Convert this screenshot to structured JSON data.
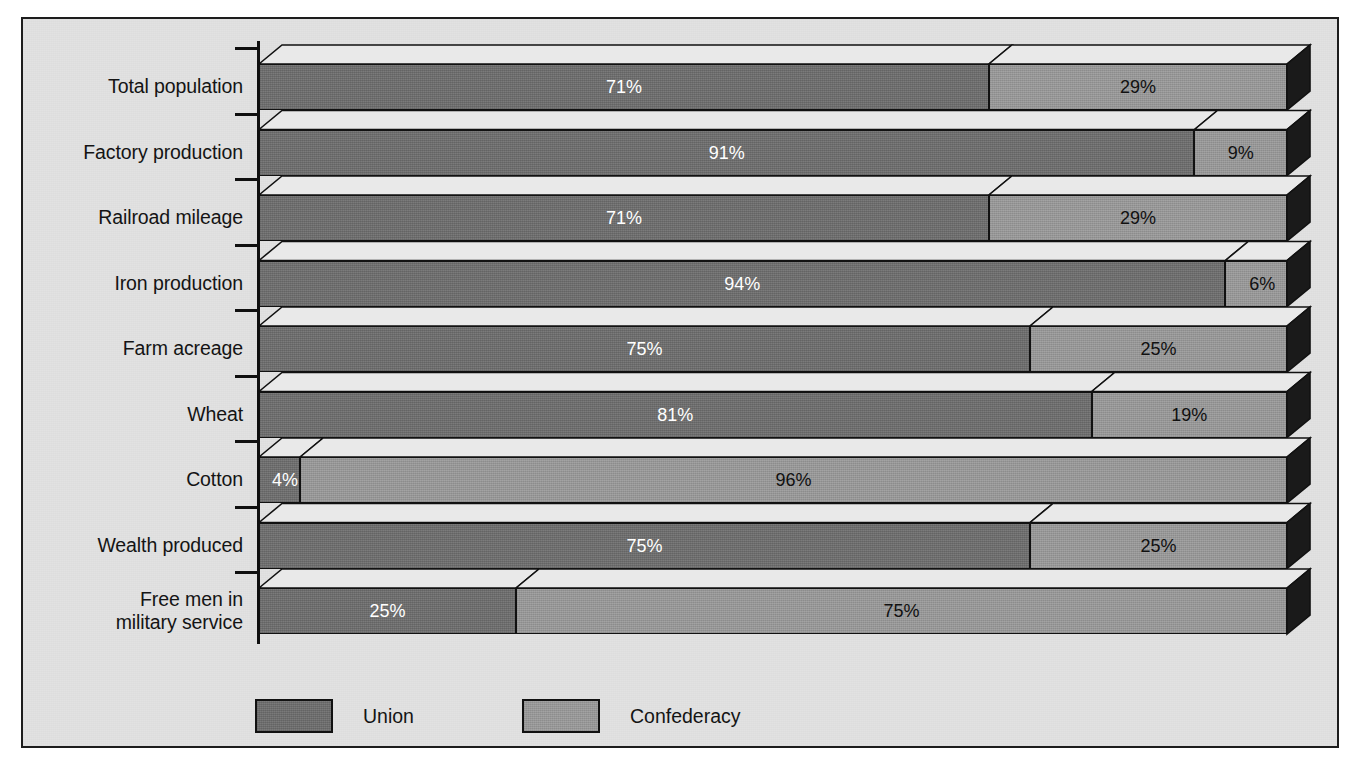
{
  "chart_data": {
    "type": "bar",
    "subtype": "stacked-horizontal-3d",
    "title": "",
    "xlabel": "",
    "ylabel": "",
    "xlim": [
      0,
      100
    ],
    "grid": false,
    "legend_position": "bottom-left",
    "categories": [
      "Total population",
      "Factory production",
      "Railroad mileage",
      "Iron production",
      "Farm acreage",
      "Wheat",
      "Cotton",
      "Wealth produced",
      "Free men in\nmilitary service"
    ],
    "series": [
      {
        "name": "Union",
        "color": "#6e6e6e",
        "values": [
          71,
          91,
          71,
          94,
          75,
          81,
          4,
          75,
          25
        ],
        "labels": [
          "71%",
          "91%",
          "71%",
          "94%",
          "75%",
          "81%",
          "4%",
          "75%",
          "25%"
        ]
      },
      {
        "name": "Confederacy",
        "color": "#9b9b9b",
        "values": [
          29,
          9,
          29,
          6,
          25,
          19,
          96,
          25,
          75
        ],
        "labels": [
          "29%",
          "9%",
          "29%",
          "6%",
          "25%",
          "19%",
          "96%",
          "25%",
          "75%"
        ]
      }
    ]
  },
  "legend": {
    "items": [
      {
        "label": "Union",
        "color": "#6e6e6e"
      },
      {
        "label": "Confederacy",
        "color": "#9b9b9b"
      }
    ]
  },
  "colors": {
    "union": "#6e6e6e",
    "confederacy": "#9b9b9b",
    "background": "#e2e2e2",
    "border": "#1d1d1d",
    "side_face": "#1a1a1a",
    "top_face": "#e9e9e9"
  }
}
